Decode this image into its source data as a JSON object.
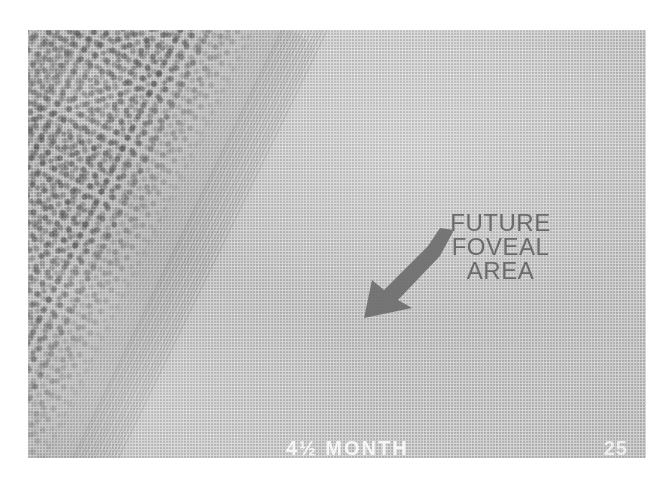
{
  "figure": {
    "kind": "photomicrograph",
    "background_color": "#ffffff",
    "plate_color": "#d7d7d7",
    "ink_color": "#6b6b6b"
  },
  "annotation": {
    "label_lines": [
      "FUTURE",
      "FOVEAL",
      "AREA"
    ],
    "line1": "FUTURE",
    "line2": "FOVEAL",
    "line3": "AREA",
    "arrow_icon": "arrow-down-left-icon",
    "arrow_color": "#6e6e6e",
    "points_to": "future foveal area"
  },
  "caption": {
    "age_label": "4½ MONTH",
    "page_number": "25"
  },
  "layers": {
    "outer_boundary": "dark limiting line",
    "photoreceptor_striations": "radial striations",
    "nuclear_layers": "dotted nuclei"
  }
}
